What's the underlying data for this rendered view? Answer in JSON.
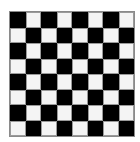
{
  "board": {
    "rows": 8,
    "cols": 8,
    "first_square": "dark",
    "colors": {
      "dark": "#000000",
      "light": "#f4f4f4",
      "border": "#8a8a8a"
    }
  }
}
